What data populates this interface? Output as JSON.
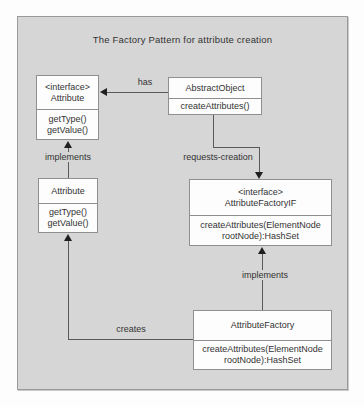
{
  "diagram": {
    "title": "The Factory Pattern for attribute creation",
    "colors": {
      "frame_fill": "#d6d6d6",
      "frame_border": "#9a9a9a",
      "box_fill": "#fdfdfd",
      "box_border": "#8f8f8f",
      "line": "#5a5a5a",
      "arrowhead": "#1f1f1f",
      "text": "#333333"
    }
  },
  "nodes": {
    "interface_attribute": {
      "stereotype": "<interface>",
      "name": "Attribute",
      "members": [
        "getType()",
        "getValue()"
      ]
    },
    "abstract_object": {
      "name": "AbstractObject",
      "members": [
        "createAttributes()"
      ]
    },
    "attribute_class": {
      "name": "Attribute",
      "members": [
        "getType()",
        "getValue()"
      ]
    },
    "attribute_factory_if": {
      "stereotype": "<interface>",
      "name": "AttributeFactoryIF",
      "members": [
        "createAttributes(ElementNode",
        "rootNode):HashSet"
      ]
    },
    "attribute_factory": {
      "name": "AttributeFactory",
      "members": [
        "createAttributes(ElementNode",
        "rootNode):HashSet"
      ]
    }
  },
  "edges": {
    "has": {
      "label": "has"
    },
    "requests_creation": {
      "label": "requests-creation"
    },
    "implements_left": {
      "label": "implements"
    },
    "implements_right": {
      "label": "implements"
    },
    "creates": {
      "label": "creates"
    }
  }
}
